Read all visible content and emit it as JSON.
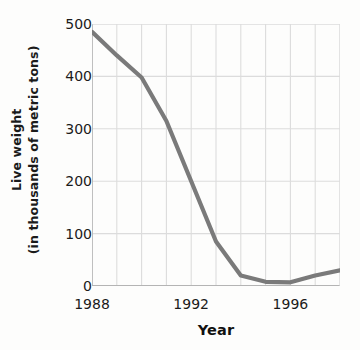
{
  "chart_data": {
    "type": "line",
    "title": "",
    "xlabel": "Year",
    "ylabel": "Live weight (in thousands of metric tons)",
    "ylabel_line1": "Live weight",
    "ylabel_line2": "(in thousands of metric tons)",
    "xlim": [
      1988,
      1998
    ],
    "ylim": [
      0,
      500
    ],
    "ytick_values": [
      0,
      100,
      200,
      300,
      400,
      500
    ],
    "ytick_labels": [
      "0",
      "100",
      "200",
      "300",
      "400",
      "500"
    ],
    "xtick_values": [
      1988,
      1992,
      1996
    ],
    "xtick_labels": [
      "1988",
      "1992",
      "1996"
    ],
    "x_gridline_values": [
      1988,
      1989,
      1990,
      1991,
      1992,
      1993,
      1994,
      1995,
      1996,
      1997,
      1998
    ],
    "grid": true,
    "legend": false,
    "x": [
      1988,
      1989,
      1990,
      1991,
      1992,
      1993,
      1994,
      1995,
      1996,
      1997,
      1998
    ],
    "values": [
      485,
      440,
      398,
      315,
      200,
      85,
      20,
      8,
      7,
      20,
      30
    ],
    "series": [
      {
        "name": "Live weight",
        "values": [
          485,
          440,
          398,
          315,
          200,
          85,
          20,
          8,
          7,
          20,
          30
        ]
      }
    ]
  },
  "style": {
    "line_color": "#7a7a7a",
    "grid_color": "#dcdcdc",
    "axis_color": "#b4b4b4",
    "text_color": "#1b1b1b",
    "background": "#fdfdfc"
  }
}
